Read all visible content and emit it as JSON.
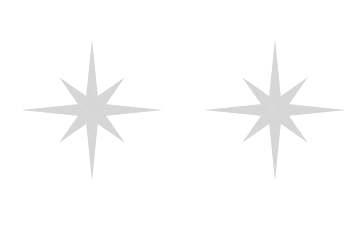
{
  "canvas": {
    "width": 362,
    "height": 225,
    "background_color": "#ffffff",
    "description": "Two identical eight-pointed sparkle stars side by side on a plain white background"
  },
  "style": {
    "star_fill_color": "#cfcfcf",
    "star_fill_color_light": "#dcdcdc",
    "star_fill_color_dark": "#c2c2c2",
    "texture": "grainy-speckled",
    "stroke": "none"
  },
  "shapes": [
    {
      "name": "star-left",
      "kind": "eight-pointed-star",
      "center_x": 92,
      "center_y": 110,
      "outer_radius_cardinal": 70,
      "outer_radius_diagonal": 46,
      "inner_radius": 15,
      "points": 8,
      "rotation_deg": 0,
      "fill": "#cfcfcf"
    },
    {
      "name": "star-right",
      "kind": "eight-pointed-star",
      "center_x": 275,
      "center_y": 110,
      "outer_radius_cardinal": 70,
      "outer_radius_diagonal": 46,
      "inner_radius": 15,
      "points": 8,
      "rotation_deg": 0,
      "fill": "#cfcfcf"
    }
  ]
}
